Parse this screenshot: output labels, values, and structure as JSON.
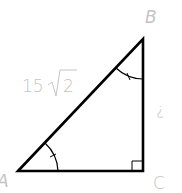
{
  "diagram": {
    "type": "right-triangle",
    "vertices": {
      "A": {
        "label": "A",
        "x": 18,
        "y": 171
      },
      "B": {
        "label": "B",
        "x": 143,
        "y": 39
      },
      "C": {
        "label": "C",
        "x": 143,
        "y": 171
      }
    },
    "hypotenuse_label_prefix": "15",
    "hypotenuse_label_radicand": "2",
    "side_BC_label": "?",
    "right_angle_at": "C",
    "congruent_angle_marks": [
      "A",
      "B"
    ],
    "line_color": "#000000",
    "label_color": "#c4c4c4"
  }
}
